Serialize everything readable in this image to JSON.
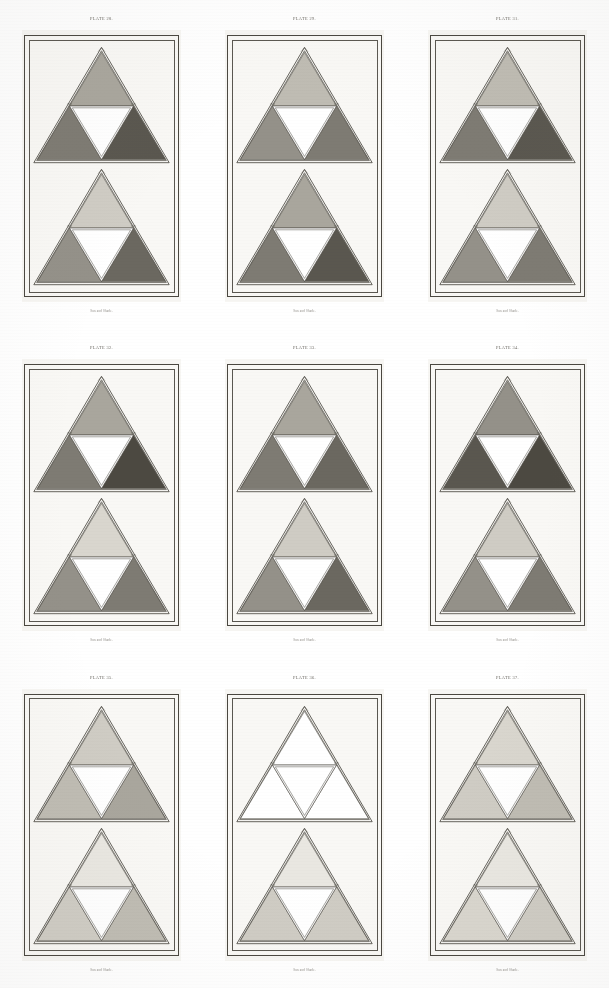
{
  "document": {
    "kind": "engraved-plate-sheet",
    "page_background": "#ffffff",
    "plate_background": "#f7f6f3",
    "rule_color": "#4a4740",
    "columns": 3,
    "rows": 3
  },
  "palette": {
    "white": "#ffffff",
    "paper": "#f9f8f5",
    "very_light_gray": "#e9e7e1",
    "light_gray": "#d9d6ce",
    "pale_gray": "#cfccc4",
    "mid_light_gray": "#bfbcb3",
    "mid_gray": "#a9a69d",
    "medium_gray": "#949189",
    "dark_mid_gray": "#7e7b73",
    "dark_gray": "#6b6860",
    "darker_gray": "#5a574f",
    "very_dark_gray": "#4c4941"
  },
  "plates": [
    {
      "title": "Plate 28.",
      "caption": "Sun and Shade.",
      "figures": [
        {
          "label": "upper",
          "top": "#a9a69d",
          "left": "#7e7b73",
          "right": "#5a574f",
          "center": "#ffffff"
        },
        {
          "label": "lower",
          "top": "#cfccc4",
          "left": "#949189",
          "right": "#6b6860",
          "center": "#ffffff"
        }
      ]
    },
    {
      "title": "Plate 29.",
      "caption": "Sun and Shade.",
      "figures": [
        {
          "label": "upper",
          "top": "#bfbcb3",
          "left": "#949189",
          "right": "#7e7b73",
          "center": "#ffffff"
        },
        {
          "label": "lower",
          "top": "#a9a69d",
          "left": "#7e7b73",
          "right": "#5a574f",
          "center": "#ffffff"
        }
      ]
    },
    {
      "title": "Plate 31.",
      "caption": "Sun and Shade.",
      "figures": [
        {
          "label": "upper",
          "top": "#bfbcb3",
          "left": "#7e7b73",
          "right": "#5a574f",
          "center": "#ffffff"
        },
        {
          "label": "lower",
          "top": "#cfccc4",
          "left": "#949189",
          "right": "#7e7b73",
          "center": "#ffffff"
        }
      ]
    },
    {
      "title": "Plate 32.",
      "caption": "Sun and Shade.",
      "figures": [
        {
          "label": "upper",
          "top": "#a9a69d",
          "left": "#7e7b73",
          "right": "#4c4941",
          "center": "#ffffff"
        },
        {
          "label": "lower",
          "top": "#d9d6ce",
          "left": "#949189",
          "right": "#7e7b73",
          "center": "#ffffff"
        }
      ]
    },
    {
      "title": "Plate 33.",
      "caption": "Sun and Shade.",
      "figures": [
        {
          "label": "upper",
          "top": "#a9a69d",
          "left": "#7e7b73",
          "right": "#6b6860",
          "center": "#ffffff"
        },
        {
          "label": "lower",
          "top": "#cfccc4",
          "left": "#949189",
          "right": "#6b6860",
          "center": "#ffffff"
        }
      ]
    },
    {
      "title": "Plate 34.",
      "caption": "Sun and Shade.",
      "figures": [
        {
          "label": "upper",
          "top": "#949189",
          "left": "#5a574f",
          "right": "#4c4941",
          "center": "#ffffff"
        },
        {
          "label": "lower",
          "top": "#cfccc4",
          "left": "#949189",
          "right": "#7e7b73",
          "center": "#ffffff"
        }
      ]
    },
    {
      "title": "Plate 35.",
      "caption": "Sun and Shade.",
      "figures": [
        {
          "label": "upper",
          "top": "#cfccc4",
          "left": "#bfbcb3",
          "right": "#a9a69d",
          "center": "#ffffff"
        },
        {
          "label": "lower",
          "top": "#e9e7e1",
          "left": "#cfccc4",
          "right": "#bfbcb3",
          "center": "#ffffff"
        }
      ]
    },
    {
      "title": "Plate 36.",
      "caption": "Sun and Shade.",
      "figures": [
        {
          "label": "upper",
          "top": "#ffffff",
          "left": "#ffffff",
          "right": "#ffffff",
          "center": "#ffffff"
        },
        {
          "label": "lower",
          "top": "#e9e7e1",
          "left": "#cfccc4",
          "right": "#cfccc4",
          "center": "#ffffff"
        }
      ]
    },
    {
      "title": "Plate 37.",
      "caption": "Sun and Shade.",
      "figures": [
        {
          "label": "upper",
          "top": "#d9d6ce",
          "left": "#cfccc4",
          "right": "#bfbcb3",
          "center": "#ffffff"
        },
        {
          "label": "lower",
          "top": "#e9e7e1",
          "left": "#d9d6ce",
          "right": "#cfccc4",
          "center": "#ffffff"
        }
      ]
    }
  ]
}
